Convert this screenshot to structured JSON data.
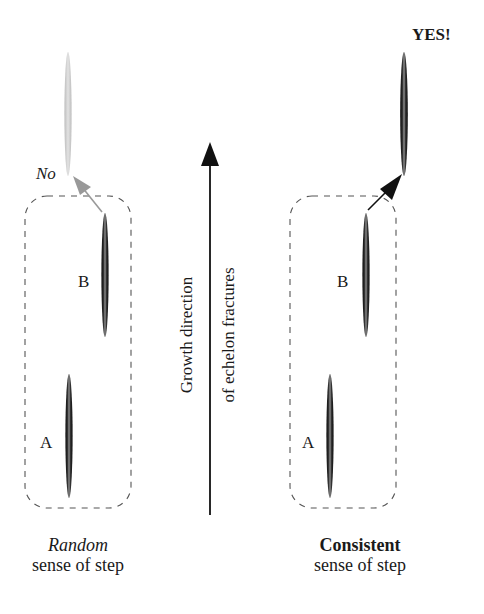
{
  "diagram": {
    "type": "echelon-fracture-step-sense",
    "center_arrow": {
      "line1": "Growth direction",
      "line2": "of echelon fractures"
    },
    "left_panel": {
      "title_emphasis": "Random",
      "subtitle": "sense of step",
      "label_a": "A",
      "label_b": "B",
      "outcome": "No",
      "outcome_color": "#a0a0a0"
    },
    "right_panel": {
      "title_emphasis": "Consistent",
      "subtitle": "sense of step",
      "label_a": "A",
      "label_b": "B",
      "outcome": "YES!",
      "outcome_color": "#111111"
    },
    "colors": {
      "fracture_dark": "#111111",
      "fracture_faded": "#c8c8c8",
      "dashed_box": "#555555",
      "arrow": "#111111"
    }
  }
}
